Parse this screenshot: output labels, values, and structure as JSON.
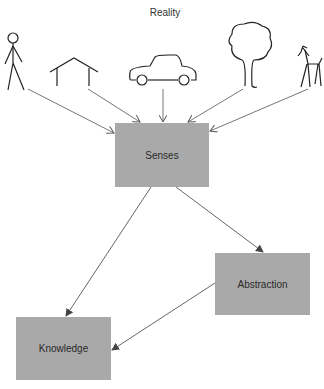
{
  "diagram": {
    "title": "Reality",
    "reality_icons": [
      {
        "name": "person-icon"
      },
      {
        "name": "house-icon"
      },
      {
        "name": "car-icon"
      },
      {
        "name": "tree-icon"
      },
      {
        "name": "deer-icon"
      }
    ],
    "nodes": {
      "senses": {
        "label": "Senses"
      },
      "abstraction": {
        "label": "Abstraction"
      },
      "knowledge": {
        "label": "Knowledge"
      }
    },
    "edges": [
      {
        "from": "person",
        "to": "Senses"
      },
      {
        "from": "house",
        "to": "Senses"
      },
      {
        "from": "car",
        "to": "Senses"
      },
      {
        "from": "tree",
        "to": "Senses"
      },
      {
        "from": "deer",
        "to": "Senses"
      },
      {
        "from": "Senses",
        "to": "Knowledge"
      },
      {
        "from": "Senses",
        "to": "Abstraction"
      },
      {
        "from": "Abstraction",
        "to": "Knowledge"
      }
    ],
    "colors": {
      "box": "#a9a9a9",
      "line": "#555555"
    }
  }
}
